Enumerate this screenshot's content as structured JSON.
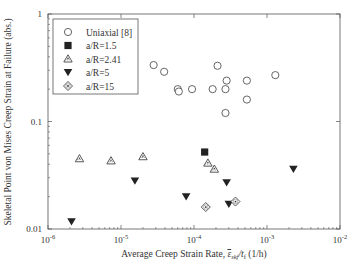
{
  "chart_data": {
    "type": "scatter",
    "title": "",
    "xlabel": "Average Creep Strain Rate, ε̄skf/tf (1/h)",
    "xlabel_parts": {
      "prefix": "Average Creep Strain Rate, ",
      "symbol": "ε",
      "sub1": "skf",
      "mid": "/t",
      "sub2": "f",
      "suffix": " (1/h)"
    },
    "ylabel": "Skeletal Point von Mises Creep Strain at Failure (abs.)",
    "xscale": "log",
    "yscale": "log",
    "xlim": [
      1e-06,
      0.01
    ],
    "ylim": [
      0.01,
      1
    ],
    "x_ticks": [
      {
        "value": 1e-06,
        "base": "10",
        "exp": "-6"
      },
      {
        "value": 1e-05,
        "base": "10",
        "exp": "-5"
      },
      {
        "value": 0.0001,
        "base": "10",
        "exp": "-4"
      },
      {
        "value": 0.001,
        "base": "10",
        "exp": "-3"
      },
      {
        "value": 0.01,
        "base": "10",
        "exp": "-2"
      }
    ],
    "y_ticks": [
      {
        "value": 0.01,
        "label": "0.01"
      },
      {
        "value": 0.1,
        "label": "0.1"
      },
      {
        "value": 1,
        "label": "1"
      }
    ],
    "grid": false,
    "legend_position": "upper left (inside)",
    "series": [
      {
        "name": "Uniaxial [8]",
        "marker": "open-circle",
        "points": [
          [
            2.8e-05,
            0.335
          ],
          [
            3.9e-05,
            0.29
          ],
          [
            6e-05,
            0.2
          ],
          [
            6.2e-05,
            0.19
          ],
          [
            9.4e-05,
            0.2
          ],
          [
            0.00018,
            0.2
          ],
          [
            0.00021,
            0.33
          ],
          [
            0.00028,
            0.24
          ],
          [
            0.00027,
            0.2
          ],
          [
            0.00053,
            0.24
          ],
          [
            0.00053,
            0.16
          ],
          [
            0.00027,
            0.12
          ],
          [
            0.0013,
            0.27
          ]
        ]
      },
      {
        "name": "a/R=1.5",
        "marker": "filled-square",
        "points": [
          [
            0.00014,
            0.052
          ]
        ]
      },
      {
        "name": "a/R=2.41",
        "marker": "dotted-triangle",
        "points": [
          [
            2.7e-06,
            0.045
          ],
          [
            7.3e-06,
            0.043
          ],
          [
            2e-05,
            0.047
          ],
          [
            0.000155,
            0.041
          ],
          [
            0.00019,
            0.036
          ]
        ]
      },
      {
        "name": "a/R=5",
        "marker": "filled-down-triangle",
        "points": [
          [
            2.1e-06,
            0.0117
          ],
          [
            1.55e-05,
            0.028
          ],
          [
            7.8e-05,
            0.02
          ],
          [
            0.00028,
            0.027
          ],
          [
            0.0003,
            0.017
          ],
          [
            0.0023,
            0.036
          ]
        ]
      },
      {
        "name": "a/R=15",
        "marker": "dotted-diamond",
        "points": [
          [
            0.000145,
            0.016
          ],
          [
            0.00037,
            0.018
          ]
        ]
      }
    ]
  },
  "style": {
    "frame_color": "#555555",
    "marker_color": "#222222",
    "open_marker_stroke": "#555555"
  }
}
